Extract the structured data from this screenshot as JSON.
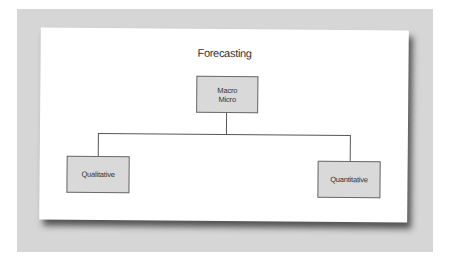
{
  "diagram": {
    "title": "Forecasting",
    "nodes": {
      "root": {
        "label": "Macro\nMicro"
      },
      "left": {
        "label": "Qualitative"
      },
      "right": {
        "label": "Quantitative"
      }
    },
    "edges": [
      {
        "from": "root",
        "to": "left"
      },
      {
        "from": "root",
        "to": "right"
      }
    ],
    "colors": {
      "node_fill": "#d9d9d9",
      "node_border": "#6a6a6a",
      "line": "#555555",
      "backdrop": "#d6d6d6"
    }
  }
}
